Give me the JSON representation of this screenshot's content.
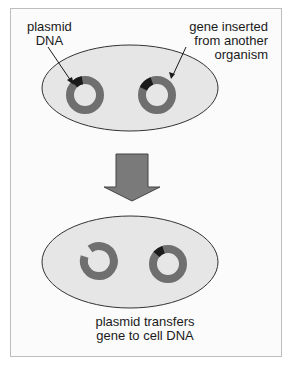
{
  "diagram": {
    "labels": {
      "plasmid": [
        "plasmid",
        "DNA"
      ],
      "gene": [
        "gene inserted",
        "from another",
        "organism"
      ],
      "caption": [
        "plasmid transfers",
        "gene to cell DNA"
      ]
    },
    "colors": {
      "cell_fill": "#e6e6e6",
      "cell_stroke": "#333333",
      "plasmid_ring": "#6f6f6f",
      "inserted_gene": "#1a1a1a",
      "arrow_fill": "#7a7a7a",
      "arrow_stroke": "#444444"
    },
    "stages": [
      {
        "name": "before",
        "plasmids": [
          {
            "type": "plasmid-with-gene",
            "gene_segment": "upper-left"
          },
          {
            "type": "plasmid-with-gene",
            "gene_segment": "upper-left"
          }
        ]
      },
      {
        "name": "after",
        "plasmids": [
          {
            "type": "open-plasmid",
            "gene_segment": "removed"
          },
          {
            "type": "cell-dna-with-gene",
            "gene_segment": "upper-left"
          }
        ]
      }
    ],
    "transition_arrow": "down-arrow"
  }
}
